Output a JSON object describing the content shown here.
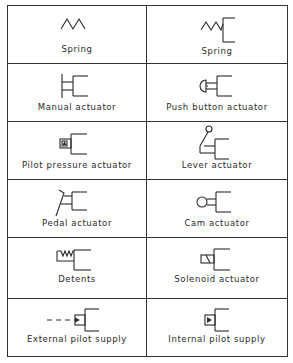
{
  "table": {
    "columns": 2,
    "rows": 6,
    "cells": [
      {
        "label": "Spring",
        "icon": "spring-icon"
      },
      {
        "label": "Spring",
        "icon": "spring-valve-icon"
      },
      {
        "label": "Manual actuator",
        "icon": "manual-actuator-icon"
      },
      {
        "label": "Push button actuator",
        "icon": "push-button-actuator-icon"
      },
      {
        "label": "Pilot pressure actuator",
        "icon": "pilot-pressure-actuator-icon"
      },
      {
        "label": "Lever actuator",
        "icon": "lever-actuator-icon"
      },
      {
        "label": "Pedal actuator",
        "icon": "pedal-actuator-icon"
      },
      {
        "label": "Cam actuator",
        "icon": "cam-actuator-icon"
      },
      {
        "label": "Detents",
        "icon": "detents-icon"
      },
      {
        "label": "Solenoid actuator",
        "icon": "solenoid-actuator-icon"
      },
      {
        "label": "External pilot supply",
        "icon": "external-pilot-supply-icon"
      },
      {
        "label": "Internal pilot supply",
        "icon": "internal-pilot-supply-icon"
      }
    ]
  },
  "colors": {
    "line": "#2a2a2a",
    "background": "#ffffff"
  }
}
